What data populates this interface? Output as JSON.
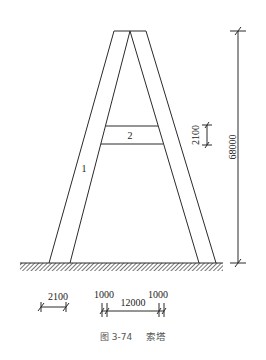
{
  "figure": {
    "caption": "图 3-74　索塔",
    "caption_number": "图 3-74",
    "caption_title": "索塔"
  },
  "labels": {
    "leg": "1",
    "crossbeam": "2"
  },
  "dimensions": {
    "tower_height": "68000",
    "crossbeam_depth": "2100",
    "leg_width": "2100",
    "base_left_offset": "1000",
    "base_span": "12000",
    "base_right_offset": "1000"
  },
  "colors": {
    "line": "#2a2a2a",
    "caption": "#555555",
    "background": "#ffffff"
  }
}
